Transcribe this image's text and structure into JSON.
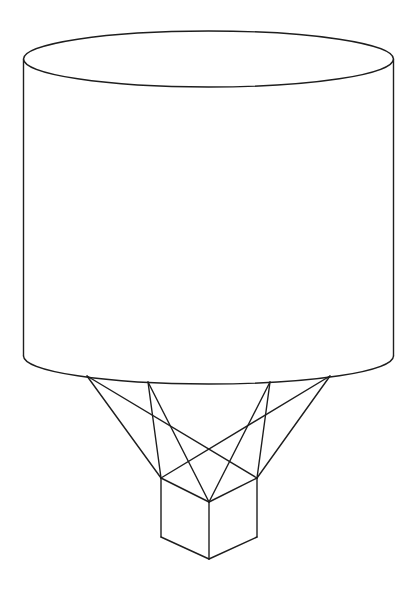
{
  "figure": {
    "width": 415,
    "height": 596,
    "background": "#ffffff",
    "stroke_color": "#1e1e1e",
    "stroke_width": 1.4
  },
  "cylinder": {
    "cx": 208.5,
    "top_cy": 59,
    "bottom_cy": 356,
    "rx": 185,
    "ry": 28
  },
  "attachment_points": [
    {
      "x": 87,
      "y": 376
    },
    {
      "x": 148,
      "y": 382
    },
    {
      "x": 270,
      "y": 382
    },
    {
      "x": 330,
      "y": 376
    }
  ],
  "cube": {
    "top_left": {
      "x": 161,
      "y": 478
    },
    "top_right": {
      "x": 257,
      "y": 478
    },
    "top_front": {
      "x": 209,
      "y": 502
    },
    "bottom_left": {
      "x": 161,
      "y": 537
    },
    "bottom_right": {
      "x": 257,
      "y": 537
    },
    "bottom_front": {
      "x": 209,
      "y": 559
    }
  },
  "cables": [
    {
      "from": 0,
      "to": "top_left"
    },
    {
      "from": 0,
      "to": "top_right"
    },
    {
      "from": 1,
      "to": "top_left"
    },
    {
      "from": 1,
      "to": "top_front"
    },
    {
      "from": 2,
      "to": "top_right"
    },
    {
      "from": 2,
      "to": "top_front"
    },
    {
      "from": 3,
      "to": "top_right"
    },
    {
      "from": 3,
      "to": "top_left"
    }
  ]
}
